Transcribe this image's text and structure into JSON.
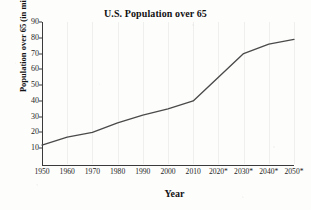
{
  "figure": {
    "background_color": "#fdfdfc",
    "ink_color": "#3a3a3a"
  },
  "chart_data": {
    "type": "line",
    "title": "U.S. Population over 65",
    "xlabel": "Year",
    "ylabel": "Population over 65 (in millions)",
    "x": [
      1950,
      1960,
      1970,
      1980,
      1990,
      2000,
      2010,
      2020,
      2030,
      2040,
      2050
    ],
    "categories": [
      "1950",
      "1960",
      "1970",
      "1980",
      "1990",
      "2000",
      "2010",
      "2020*",
      "2030*",
      "2040*",
      "2050*"
    ],
    "values": [
      12,
      17,
      20,
      26,
      31,
      35,
      40,
      55,
      70,
      76,
      79
    ],
    "series": [
      {
        "name": "Population over 65 (in millions)",
        "values": [
          12,
          17,
          20,
          26,
          31,
          35,
          40,
          55,
          70,
          76,
          79
        ],
        "color": "#4a4a4a"
      }
    ],
    "xlim": [
      1950,
      2050
    ],
    "ylim": [
      0,
      90
    ],
    "yticks": [
      10,
      20,
      30,
      40,
      50,
      60,
      70,
      80,
      90
    ],
    "ytick_labels": [
      "10",
      "20",
      "30",
      "40",
      "50",
      "60",
      "70",
      "80",
      "90"
    ],
    "xticks": [
      1950,
      1960,
      1970,
      1980,
      1990,
      2000,
      2010,
      2020,
      2030,
      2040,
      2050
    ],
    "grid": "vertical-faint",
    "legend": "none",
    "annotations": [
      "* denotes projected values"
    ]
  }
}
